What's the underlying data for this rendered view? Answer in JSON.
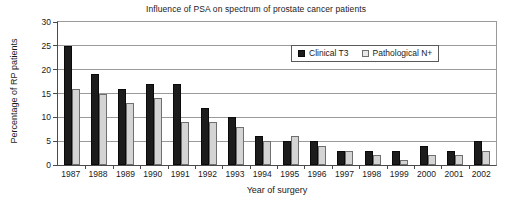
{
  "chart_data": {
    "type": "bar",
    "title": "Influence of PSA on spectrum of prostate cancer patients",
    "xlabel": "Year of surgery",
    "ylabel": "Percentage of RP patients",
    "ylim": [
      0,
      30
    ],
    "ytick_step": 5,
    "yticks": [
      "0",
      "5",
      "10",
      "15",
      "20",
      "25",
      "30"
    ],
    "grid": true,
    "legend_position": "top-right inside plot",
    "categories": [
      "1987",
      "1988",
      "1989",
      "1990",
      "1991",
      "1992",
      "1993",
      "1994",
      "1995",
      "1996",
      "1997",
      "1998",
      "1999",
      "2000",
      "2001",
      "2002"
    ],
    "series": [
      {
        "name": "Clinical T3",
        "color": "#1c1c1c",
        "values": [
          25,
          19,
          16,
          17,
          17,
          12,
          10,
          6,
          5,
          5,
          3,
          3,
          3,
          4,
          3,
          5
        ]
      },
      {
        "name": "Pathological N+",
        "color": "#d4d4d4",
        "values": [
          16,
          15,
          13,
          14,
          9,
          9,
          8,
          5,
          6,
          4,
          3,
          2,
          1,
          2,
          2,
          3
        ]
      }
    ]
  },
  "legend": {
    "items": [
      {
        "label": "Clinical T3",
        "swatch": "filled-black-square-icon"
      },
      {
        "label": "Pathological N+",
        "swatch": "outlined-light-square-icon"
      }
    ]
  }
}
